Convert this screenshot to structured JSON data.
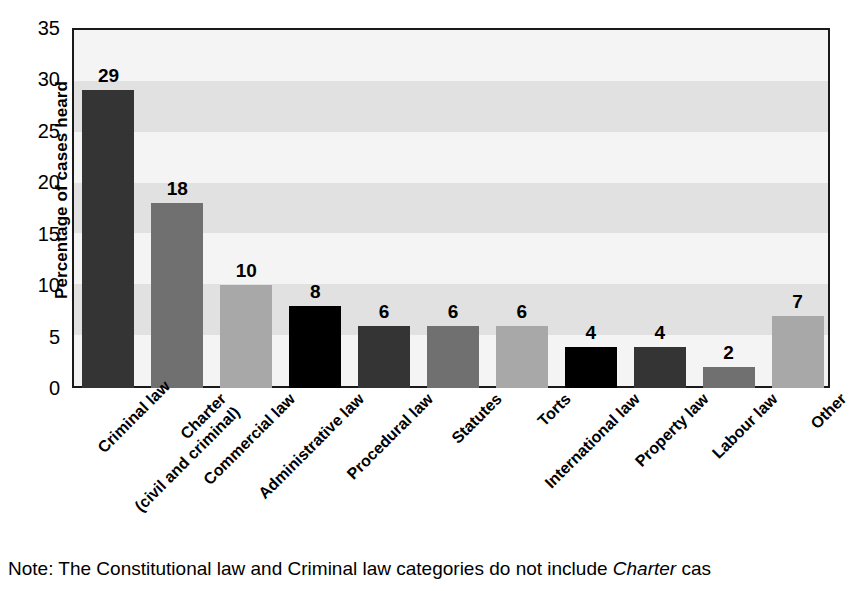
{
  "chart_data": {
    "type": "bar",
    "title": "",
    "xlabel": "",
    "ylabel": "Percentage of cases heard",
    "ylim": [
      0,
      35
    ],
    "yticks": [
      0,
      5,
      10,
      15,
      20,
      25,
      30,
      35
    ],
    "grid": "horizontal-alternating-bands",
    "legend": "none",
    "categories": [
      "Criminal law",
      "Charter\n(civil and criminal)",
      "Commercial law",
      "Administrative law",
      "Procedural law",
      "Statutes",
      "Torts",
      "International law",
      "Property law",
      "Labour law",
      "Other"
    ],
    "values": [
      29,
      18,
      10,
      8,
      6,
      6,
      6,
      4,
      4,
      2,
      7
    ],
    "bar_colors": [
      "#343434",
      "#707070",
      "#a8a8a8",
      "#000000",
      "#343434",
      "#707070",
      "#a8a8a8",
      "#000000",
      "#343434",
      "#707070",
      "#a8a8a8"
    ],
    "bars": [
      {
        "label": "Criminal law",
        "label_line1": "Criminal law",
        "label_line2": "",
        "value": 29,
        "color": "#343434"
      },
      {
        "label": "Charter (civil and criminal)",
        "label_line1": "Charter",
        "label_line2": "(civil and criminal)",
        "value": 18,
        "color": "#707070"
      },
      {
        "label": "Commercial law",
        "label_line1": "Commercial law",
        "label_line2": "",
        "value": 10,
        "color": "#a8a8a8"
      },
      {
        "label": "Administrative law",
        "label_line1": "Administrative law",
        "label_line2": "",
        "value": 8,
        "color": "#000000"
      },
      {
        "label": "Procedural law",
        "label_line1": "Procedural law",
        "label_line2": "",
        "value": 6,
        "color": "#343434"
      },
      {
        "label": "Statutes",
        "label_line1": "Statutes",
        "label_line2": "",
        "value": 6,
        "color": "#707070"
      },
      {
        "label": "Torts",
        "label_line1": "Torts",
        "label_line2": "",
        "value": 6,
        "color": "#a8a8a8"
      },
      {
        "label": "International law",
        "label_line1": "International law",
        "label_line2": "",
        "value": 4,
        "color": "#000000"
      },
      {
        "label": "Property law",
        "label_line1": "Property law",
        "label_line2": "",
        "value": 4,
        "color": "#343434"
      },
      {
        "label": "Labour law",
        "label_line1": "Labour law",
        "label_line2": "",
        "value": 2,
        "color": "#707070"
      },
      {
        "label": "Other",
        "label_line1": "Other",
        "label_line2": "",
        "value": 7,
        "color": "#a8a8a8"
      }
    ]
  },
  "axis": {
    "y_title": "Percentage of cases heard",
    "y_ticks": [
      "35",
      "30",
      "25",
      "20",
      "15",
      "10",
      "5",
      "0"
    ]
  },
  "note": {
    "prefix": "Note: The Constitutional law and Criminal law categories do not include ",
    "italic": "Charter",
    "suffix": " cas"
  },
  "colors": {
    "plot_border": "#1a1a1a",
    "band_light": "#f4f4f4",
    "band_dark": "#e1e1e1",
    "text": "#000000",
    "background": "#ffffff"
  }
}
